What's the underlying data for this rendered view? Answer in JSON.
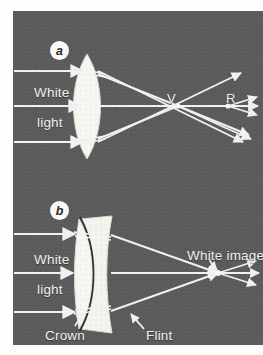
{
  "figure": {
    "background_color": "#5b5b5b",
    "ink_color": "#f2f2f2",
    "panels": [
      {
        "tag": "a",
        "caption": "Simple converging lens: violet focuses nearer than red",
        "labels": {
          "white": "White",
          "light": "light",
          "violet_focus": "V",
          "red_focus": "R"
        }
      },
      {
        "tag": "b",
        "caption": "Achromatic doublet: crown plus flint bring colours to one focus",
        "labels": {
          "white": "White",
          "light": "light",
          "image": "White image",
          "crown": "Crown",
          "flint": "Flint"
        }
      }
    ]
  },
  "icons": {
    "ray_arrow": "ray-arrowhead",
    "leader_arrow": "leader-arrowhead"
  }
}
